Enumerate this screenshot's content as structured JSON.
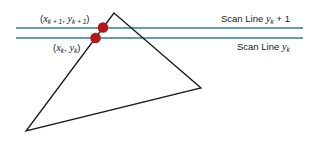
{
  "diagram": {
    "scan_lines": [
      {
        "id": "upper",
        "label_prefix": "Scan Line ",
        "label_var": "y",
        "label_sub": "k",
        "label_suffix": " + 1",
        "y": 28
      },
      {
        "id": "lower",
        "label_prefix": "Scan Line ",
        "label_var": "y",
        "label_sub": "k",
        "label_suffix": "",
        "y": 38
      }
    ],
    "points": [
      {
        "id": "upper",
        "label": "(x_{k+1}, y_{k+1})",
        "x_var": "x",
        "x_sub": "k + 1",
        "y_var": "y",
        "y_sub": "k + 1"
      },
      {
        "id": "lower",
        "label": "(x_k, y_k)",
        "x_var": "x",
        "x_sub": "k",
        "y_var": "y",
        "y_sub": "k"
      }
    ],
    "triangle_vertices": [
      [
        114,
        13
      ],
      [
        201,
        88
      ],
      [
        26,
        131
      ]
    ],
    "colors": {
      "scan_line": "#2f7f8f",
      "point": "#b3191c",
      "edge": "#1a1a1a"
    }
  }
}
